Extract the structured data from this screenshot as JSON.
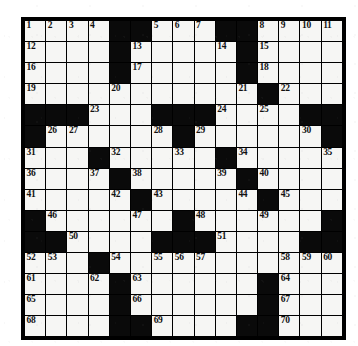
{
  "puzzle": {
    "type": "crossword-grid",
    "title": "",
    "rows": 15,
    "columns": 15,
    "colors": {
      "block": "#0a0a0a",
      "cell": "#f6f6f4",
      "border": "#000000",
      "number": "#111111",
      "background": "#ffffff"
    },
    "highest_clue_number": 70,
    "grid": [
      [
        {
          "type": "white",
          "number": "1"
        },
        {
          "type": "white",
          "number": "2"
        },
        {
          "type": "white",
          "number": "3"
        },
        {
          "type": "white",
          "number": "4"
        },
        {
          "type": "black",
          "number": ""
        },
        {
          "type": "black",
          "number": ""
        },
        {
          "type": "white",
          "number": "5"
        },
        {
          "type": "white",
          "number": "6"
        },
        {
          "type": "white",
          "number": "7"
        },
        {
          "type": "black",
          "number": ""
        },
        {
          "type": "black",
          "number": ""
        },
        {
          "type": "white",
          "number": "8"
        },
        {
          "type": "white",
          "number": "9"
        },
        {
          "type": "white",
          "number": "10"
        },
        {
          "type": "white",
          "number": "11"
        }
      ],
      [
        {
          "type": "white",
          "number": "12"
        },
        {
          "type": "white",
          "number": ""
        },
        {
          "type": "white",
          "number": ""
        },
        {
          "type": "white",
          "number": ""
        },
        {
          "type": "black",
          "number": ""
        },
        {
          "type": "white",
          "number": "13"
        },
        {
          "type": "white",
          "number": ""
        },
        {
          "type": "white",
          "number": ""
        },
        {
          "type": "white",
          "number": ""
        },
        {
          "type": "white",
          "number": "14"
        },
        {
          "type": "black",
          "number": ""
        },
        {
          "type": "white",
          "number": "15"
        },
        {
          "type": "white",
          "number": ""
        },
        {
          "type": "white",
          "number": ""
        },
        {
          "type": "white",
          "number": ""
        }
      ],
      [
        {
          "type": "white",
          "number": "16"
        },
        {
          "type": "white",
          "number": ""
        },
        {
          "type": "white",
          "number": ""
        },
        {
          "type": "white",
          "number": ""
        },
        {
          "type": "black",
          "number": ""
        },
        {
          "type": "white",
          "number": "17"
        },
        {
          "type": "white",
          "number": ""
        },
        {
          "type": "white",
          "number": ""
        },
        {
          "type": "white",
          "number": ""
        },
        {
          "type": "white",
          "number": ""
        },
        {
          "type": "black",
          "number": ""
        },
        {
          "type": "white",
          "number": "18"
        },
        {
          "type": "white",
          "number": ""
        },
        {
          "type": "white",
          "number": ""
        },
        {
          "type": "white",
          "number": ""
        }
      ],
      [
        {
          "type": "white",
          "number": "19"
        },
        {
          "type": "white",
          "number": ""
        },
        {
          "type": "white",
          "number": ""
        },
        {
          "type": "white",
          "number": ""
        },
        {
          "type": "white",
          "number": "20"
        },
        {
          "type": "white",
          "number": ""
        },
        {
          "type": "white",
          "number": ""
        },
        {
          "type": "white",
          "number": ""
        },
        {
          "type": "white",
          "number": ""
        },
        {
          "type": "white",
          "number": ""
        },
        {
          "type": "white",
          "number": "21"
        },
        {
          "type": "black",
          "number": ""
        },
        {
          "type": "white",
          "number": "22"
        },
        {
          "type": "white",
          "number": ""
        },
        {
          "type": "white",
          "number": ""
        }
      ],
      [
        {
          "type": "black",
          "number": ""
        },
        {
          "type": "black",
          "number": ""
        },
        {
          "type": "black",
          "number": ""
        },
        {
          "type": "white",
          "number": "23"
        },
        {
          "type": "white",
          "number": ""
        },
        {
          "type": "white",
          "number": ""
        },
        {
          "type": "black",
          "number": ""
        },
        {
          "type": "black",
          "number": ""
        },
        {
          "type": "black",
          "number": ""
        },
        {
          "type": "white",
          "number": "24"
        },
        {
          "type": "white",
          "number": ""
        },
        {
          "type": "white",
          "number": "25"
        },
        {
          "type": "white",
          "number": ""
        },
        {
          "type": "black",
          "number": ""
        },
        {
          "type": "black",
          "number": ""
        }
      ],
      [
        {
          "type": "black",
          "number": ""
        },
        {
          "type": "white",
          "number": "26"
        },
        {
          "type": "white",
          "number": "27"
        },
        {
          "type": "white",
          "number": ""
        },
        {
          "type": "white",
          "number": ""
        },
        {
          "type": "white",
          "number": ""
        },
        {
          "type": "white",
          "number": "28"
        },
        {
          "type": "black",
          "number": ""
        },
        {
          "type": "white",
          "number": "29"
        },
        {
          "type": "white",
          "number": ""
        },
        {
          "type": "white",
          "number": ""
        },
        {
          "type": "white",
          "number": ""
        },
        {
          "type": "white",
          "number": ""
        },
        {
          "type": "white",
          "number": "30"
        },
        {
          "type": "black",
          "number": ""
        }
      ],
      [
        {
          "type": "white",
          "number": "31"
        },
        {
          "type": "white",
          "number": ""
        },
        {
          "type": "white",
          "number": ""
        },
        {
          "type": "black",
          "number": ""
        },
        {
          "type": "white",
          "number": "32"
        },
        {
          "type": "white",
          "number": ""
        },
        {
          "type": "white",
          "number": ""
        },
        {
          "type": "white",
          "number": "33"
        },
        {
          "type": "white",
          "number": ""
        },
        {
          "type": "black",
          "number": ""
        },
        {
          "type": "white",
          "number": "34"
        },
        {
          "type": "white",
          "number": ""
        },
        {
          "type": "white",
          "number": ""
        },
        {
          "type": "white",
          "number": ""
        },
        {
          "type": "white",
          "number": "35"
        }
      ],
      [
        {
          "type": "white",
          "number": "36"
        },
        {
          "type": "white",
          "number": ""
        },
        {
          "type": "white",
          "number": ""
        },
        {
          "type": "white",
          "number": "37"
        },
        {
          "type": "black",
          "number": ""
        },
        {
          "type": "white",
          "number": "38"
        },
        {
          "type": "white",
          "number": ""
        },
        {
          "type": "white",
          "number": ""
        },
        {
          "type": "white",
          "number": ""
        },
        {
          "type": "white",
          "number": "39"
        },
        {
          "type": "black",
          "number": ""
        },
        {
          "type": "white",
          "number": "40"
        },
        {
          "type": "white",
          "number": ""
        },
        {
          "type": "white",
          "number": ""
        },
        {
          "type": "white",
          "number": ""
        }
      ],
      [
        {
          "type": "white",
          "number": "41"
        },
        {
          "type": "white",
          "number": ""
        },
        {
          "type": "white",
          "number": ""
        },
        {
          "type": "white",
          "number": ""
        },
        {
          "type": "white",
          "number": "42"
        },
        {
          "type": "black",
          "number": ""
        },
        {
          "type": "white",
          "number": "43"
        },
        {
          "type": "white",
          "number": ""
        },
        {
          "type": "white",
          "number": ""
        },
        {
          "type": "white",
          "number": ""
        },
        {
          "type": "white",
          "number": "44"
        },
        {
          "type": "black",
          "number": ""
        },
        {
          "type": "white",
          "number": "45"
        },
        {
          "type": "white",
          "number": ""
        },
        {
          "type": "white",
          "number": ""
        }
      ],
      [
        {
          "type": "black",
          "number": ""
        },
        {
          "type": "white",
          "number": "46"
        },
        {
          "type": "white",
          "number": ""
        },
        {
          "type": "white",
          "number": ""
        },
        {
          "type": "white",
          "number": ""
        },
        {
          "type": "white",
          "number": "47"
        },
        {
          "type": "white",
          "number": ""
        },
        {
          "type": "black",
          "number": ""
        },
        {
          "type": "white",
          "number": "48"
        },
        {
          "type": "white",
          "number": ""
        },
        {
          "type": "white",
          "number": ""
        },
        {
          "type": "white",
          "number": "49"
        },
        {
          "type": "white",
          "number": ""
        },
        {
          "type": "white",
          "number": ""
        },
        {
          "type": "black",
          "number": ""
        }
      ],
      [
        {
          "type": "black",
          "number": ""
        },
        {
          "type": "black",
          "number": ""
        },
        {
          "type": "white",
          "number": "50"
        },
        {
          "type": "white",
          "number": ""
        },
        {
          "type": "white",
          "number": ""
        },
        {
          "type": "white",
          "number": ""
        },
        {
          "type": "black",
          "number": ""
        },
        {
          "type": "black",
          "number": ""
        },
        {
          "type": "black",
          "number": ""
        },
        {
          "type": "white",
          "number": "51"
        },
        {
          "type": "white",
          "number": ""
        },
        {
          "type": "white",
          "number": ""
        },
        {
          "type": "white",
          "number": ""
        },
        {
          "type": "black",
          "number": ""
        },
        {
          "type": "black",
          "number": ""
        }
      ],
      [
        {
          "type": "white",
          "number": "52"
        },
        {
          "type": "white",
          "number": "53"
        },
        {
          "type": "white",
          "number": ""
        },
        {
          "type": "black",
          "number": ""
        },
        {
          "type": "white",
          "number": "54"
        },
        {
          "type": "white",
          "number": ""
        },
        {
          "type": "white",
          "number": "55"
        },
        {
          "type": "white",
          "number": "56"
        },
        {
          "type": "white",
          "number": "57"
        },
        {
          "type": "white",
          "number": ""
        },
        {
          "type": "white",
          "number": ""
        },
        {
          "type": "white",
          "number": ""
        },
        {
          "type": "white",
          "number": "58"
        },
        {
          "type": "white",
          "number": "59"
        },
        {
          "type": "white",
          "number": "60"
        }
      ],
      [
        {
          "type": "white",
          "number": "61"
        },
        {
          "type": "white",
          "number": ""
        },
        {
          "type": "white",
          "number": ""
        },
        {
          "type": "white",
          "number": "62"
        },
        {
          "type": "black",
          "number": ""
        },
        {
          "type": "white",
          "number": "63"
        },
        {
          "type": "white",
          "number": ""
        },
        {
          "type": "white",
          "number": ""
        },
        {
          "type": "white",
          "number": ""
        },
        {
          "type": "white",
          "number": ""
        },
        {
          "type": "white",
          "number": ""
        },
        {
          "type": "black",
          "number": ""
        },
        {
          "type": "white",
          "number": "64"
        },
        {
          "type": "white",
          "number": ""
        },
        {
          "type": "white",
          "number": ""
        }
      ],
      [
        {
          "type": "white",
          "number": "65"
        },
        {
          "type": "white",
          "number": ""
        },
        {
          "type": "white",
          "number": ""
        },
        {
          "type": "white",
          "number": ""
        },
        {
          "type": "black",
          "number": ""
        },
        {
          "type": "white",
          "number": "66"
        },
        {
          "type": "white",
          "number": ""
        },
        {
          "type": "white",
          "number": ""
        },
        {
          "type": "white",
          "number": ""
        },
        {
          "type": "white",
          "number": ""
        },
        {
          "type": "white",
          "number": ""
        },
        {
          "type": "black",
          "number": ""
        },
        {
          "type": "white",
          "number": "67"
        },
        {
          "type": "white",
          "number": ""
        },
        {
          "type": "white",
          "number": ""
        }
      ],
      [
        {
          "type": "white",
          "number": "68"
        },
        {
          "type": "white",
          "number": ""
        },
        {
          "type": "white",
          "number": ""
        },
        {
          "type": "white",
          "number": ""
        },
        {
          "type": "black",
          "number": ""
        },
        {
          "type": "black",
          "number": ""
        },
        {
          "type": "white",
          "number": "69"
        },
        {
          "type": "white",
          "number": ""
        },
        {
          "type": "white",
          "number": ""
        },
        {
          "type": "white",
          "number": ""
        },
        {
          "type": "black",
          "number": ""
        },
        {
          "type": "black",
          "number": ""
        },
        {
          "type": "white",
          "number": "70"
        },
        {
          "type": "white",
          "number": ""
        },
        {
          "type": "white",
          "number": ""
        }
      ]
    ]
  }
}
